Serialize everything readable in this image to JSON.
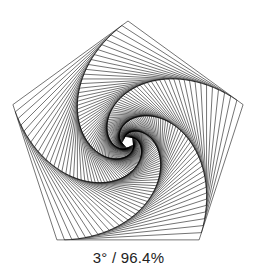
{
  "diagram": {
    "shape": "pentagon",
    "sides": 5,
    "center": [
      128,
      142
    ],
    "outer_radius": 121,
    "rotation_step_deg": 3,
    "scale_factor": 0.964,
    "iterations": 82,
    "stroke_color": "#000000",
    "stroke_width": 0.55,
    "background_color": "#ffffff"
  },
  "caption": {
    "text": "3° / 96.4%"
  }
}
